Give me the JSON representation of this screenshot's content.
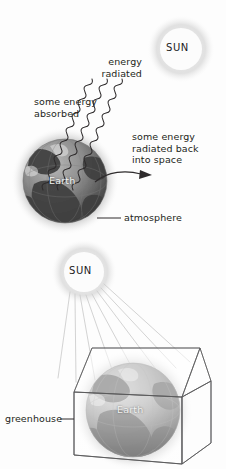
{
  "figure": {
    "title_visible": false,
    "background_color": "#fdfdfd",
    "text_color": "#231f20",
    "earth_label_color": "#f2f2f2"
  },
  "panels": {
    "top": {
      "name": "earth-atmosphere-radiation",
      "sun": {
        "label": "SUN",
        "cx": 181,
        "cy": 49,
        "r": 21
      },
      "earth": {
        "label": "Earth",
        "cx": 65,
        "cy": 181,
        "r": 43
      },
      "labels": {
        "energy_radiated": "energy\nradiated",
        "some_energy_absorbed": "some energy\nabsorbed",
        "some_energy_back": "some energy\nradiated back\ninto space",
        "atmosphere": "atmosphere"
      }
    },
    "bottom": {
      "name": "greenhouse-effect",
      "sun": {
        "label": "SUN",
        "cx": 84,
        "cy": 272,
        "r": 21
      },
      "earth": {
        "label": "Earth",
        "cx": 133,
        "cy": 410,
        "r": 48
      },
      "labels": {
        "greenhouse": "greenhouse"
      }
    }
  },
  "icons": {
    "sun_glow": "sun-glow-icon",
    "earth_globe": "earth-globe-icon",
    "wavy_ray": "wavy-radiation-ray-icon",
    "straight_ray": "straight-light-ray-icon",
    "curved_arrow": "curved-arrow-icon",
    "leader_line": "leader-line-icon",
    "greenhouse_box": "greenhouse-box-icon"
  }
}
